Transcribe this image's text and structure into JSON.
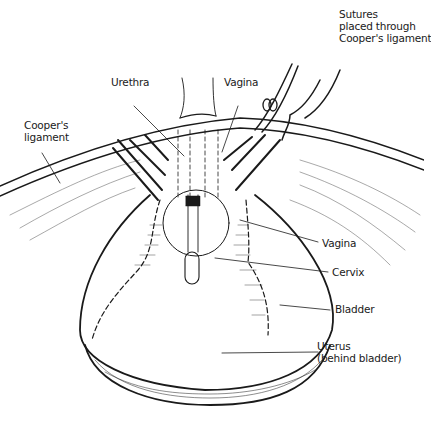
{
  "figure": {
    "labels": {
      "sutures": [
        "Sutures",
        "placed through",
        "Cooper's ligament"
      ],
      "urethra": "Urethra",
      "vagina_top": "Vagina",
      "coopers": [
        "Cooper's",
        "ligament"
      ],
      "vagina_right": "Vagina",
      "cervix": "Cervix",
      "bladder": "Bladder",
      "uterus": [
        "Uterus",
        "(behind bladder)"
      ]
    },
    "colors": {
      "ink": "#1a1a1a",
      "background": "#ffffff"
    }
  }
}
